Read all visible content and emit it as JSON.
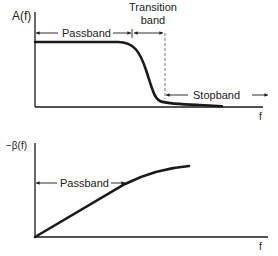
{
  "diagram": {
    "top_plot": {
      "y_label": "A(f)",
      "x_label": "f",
      "regions": {
        "passband": "Passband",
        "transition_line1": "Transition",
        "transition_line2": "band",
        "stopband": "Stopband"
      },
      "curve": "amplitude response: flat in passband, steep roll-off in transition band, near zero in stopband"
    },
    "bottom_plot": {
      "y_label": "−β(f)",
      "x_label": "f",
      "regions": {
        "passband": "Passband"
      },
      "curve": "phase response: linear in passband, curving over beyond"
    },
    "colors": {
      "stroke": "#1a1a1a",
      "background": "#ffffff"
    }
  }
}
